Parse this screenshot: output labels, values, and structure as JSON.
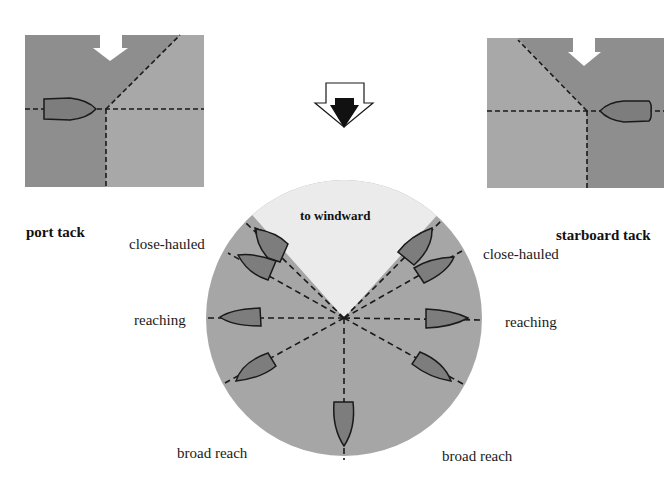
{
  "colors": {
    "dark_gray": "#8e8e8e",
    "mid_gray": "#a6a6a6",
    "light_gray": "#ebebeb",
    "boat_fill": "#7d7d7d",
    "line": "#1a1a1a",
    "background": "#ffffff"
  },
  "port_panel": {
    "label": "port tack"
  },
  "starboard_panel": {
    "label": "starboard tack"
  },
  "wind_arrow": {
    "icon": "wind-direction-arrow-icon"
  },
  "circle": {
    "windward_label": "to windward",
    "labels": {
      "left_close_hauled": "close-hauled",
      "right_close_hauled": "close-hauled",
      "left_reaching": "reaching",
      "right_reaching": "reaching",
      "left_broad_reach": "broad reach",
      "right_broad_reach": "broad reach"
    }
  }
}
